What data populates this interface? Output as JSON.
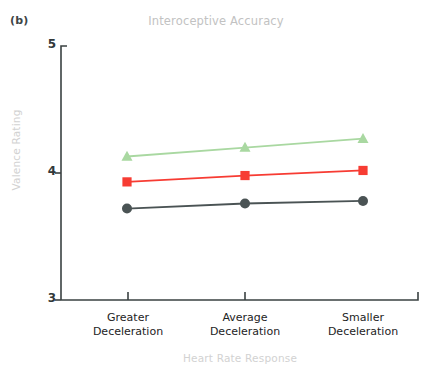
{
  "panel": {
    "label": "(b)"
  },
  "colors": {
    "series_dark": "#4a5354",
    "series_red": "#f73c33",
    "series_green": "#a9d8a1",
    "axis": "#3a4142",
    "title_text": "#c2c2c2",
    "axis_label_text": "#d2d2d2",
    "tick_text": "#1d2324"
  },
  "chart_data": {
    "type": "line",
    "title": "Interoceptive Accuracy",
    "xlabel": "Heart Rate Response",
    "ylabel": "Valence Rating",
    "categories": [
      "Greater Deceleration",
      "Average Deceleration",
      "Smaller Deceleration"
    ],
    "category_lines": [
      [
        "Greater",
        "Deceleration"
      ],
      [
        "Average",
        "Deceleration"
      ],
      [
        "Smaller",
        "Deceleration"
      ]
    ],
    "ylim": [
      3,
      5
    ],
    "yticks": [
      3,
      4,
      5
    ],
    "ytick_labels": [
      "3",
      "4",
      "5"
    ],
    "grid": false,
    "legend": "none",
    "series": [
      {
        "name": "High Interoceptive Accuracy",
        "marker": "triangle",
        "color": "#a9d8a1",
        "values": [
          4.13,
          4.2,
          4.27
        ]
      },
      {
        "name": "Average Interoceptive Accuracy",
        "marker": "square",
        "color": "#f73c33",
        "values": [
          3.93,
          3.98,
          4.02
        ]
      },
      {
        "name": "Low Interoceptive Accuracy",
        "marker": "circle",
        "color": "#4a5354",
        "values": [
          3.72,
          3.76,
          3.78
        ]
      }
    ]
  }
}
